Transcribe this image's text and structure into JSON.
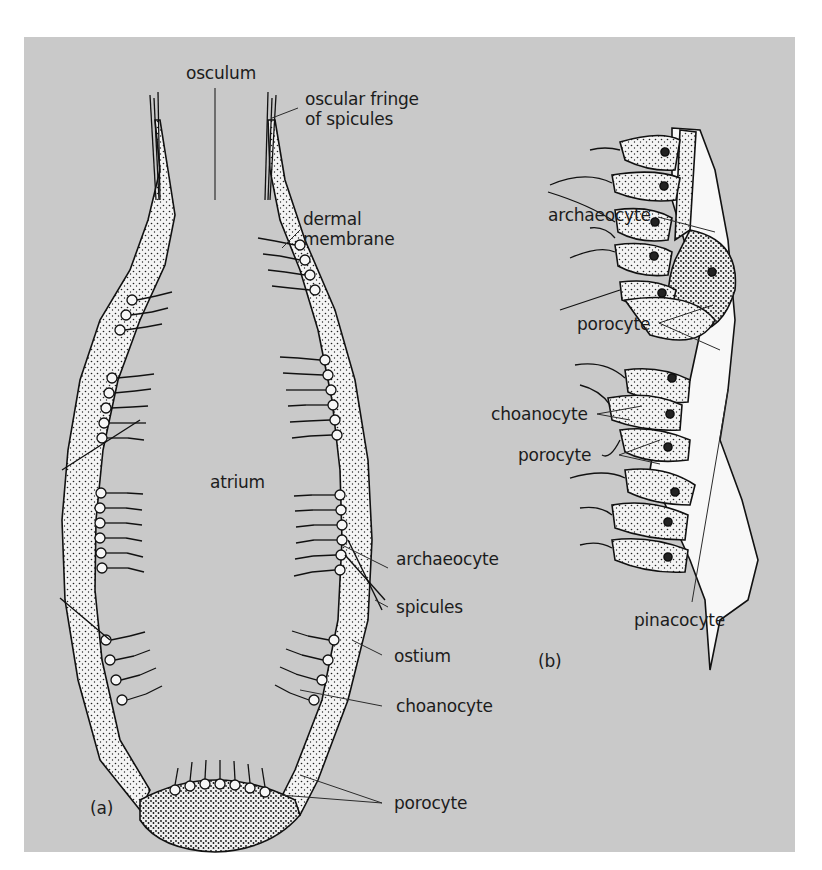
{
  "figure": {
    "background_color": "#c9c9c9",
    "ink_color": "#1a1a1a",
    "panel_a": {
      "panel_label": "(a)",
      "labels": {
        "osculum": "osculum",
        "oscular_fringe": "oscular fringe of spicules",
        "dermal_membrane": "dermal membrane",
        "atrium": "atrium",
        "archaeocyte": "archaeocyte",
        "spicules": "spicules",
        "ostium": "ostium",
        "choanocyte": "choanocyte",
        "porocyte": "porocyte"
      }
    },
    "panel_b": {
      "panel_label": "(b)",
      "labels": {
        "archaeocyte": "archaeocyte",
        "porocyte_upper": "porocyte",
        "choanocyte": "choanocyte",
        "porocyte_lower": "porocyte",
        "pinacocyte": "pinacocyte"
      }
    }
  }
}
